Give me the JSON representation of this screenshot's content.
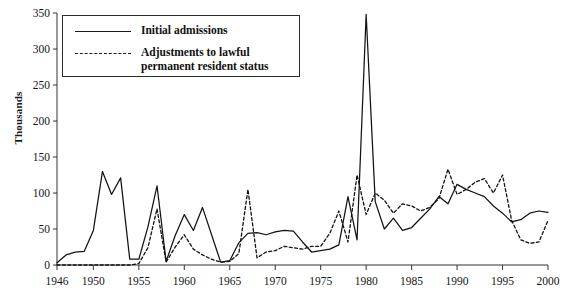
{
  "chart_data": {
    "type": "line",
    "title": "",
    "xlabel": "",
    "ylabel": "Thousands",
    "xlim": [
      1946,
      2000
    ],
    "ylim": [
      0,
      350
    ],
    "grid": false,
    "legend_position": "top-left",
    "ytick_labels": [
      "0",
      "50",
      "100",
      "150",
      "200",
      "250",
      "300",
      "350"
    ],
    "ytick_values": [
      0,
      50,
      100,
      150,
      200,
      250,
      300,
      350
    ],
    "xtick_labels": [
      "1946",
      "1950",
      "1955",
      "1960",
      "1965",
      "1970",
      "1975",
      "1980",
      "1985",
      "1990",
      "1995",
      "2000"
    ],
    "xtick_values": [
      1946,
      1950,
      1955,
      1960,
      1965,
      1970,
      1975,
      1980,
      1985,
      1990,
      1995,
      2000
    ],
    "x": [
      1946,
      1947,
      1948,
      1949,
      1950,
      1951,
      1952,
      1953,
      1954,
      1955,
      1956,
      1957,
      1958,
      1959,
      1960,
      1961,
      1962,
      1963,
      1964,
      1965,
      1966,
      1967,
      1968,
      1969,
      1970,
      1971,
      1972,
      1973,
      1974,
      1975,
      1976,
      1977,
      1978,
      1979,
      1980,
      1981,
      1982,
      1983,
      1984,
      1985,
      1986,
      1987,
      1988,
      1989,
      1990,
      1991,
      1992,
      1993,
      1994,
      1995,
      1996,
      1997,
      1998,
      1999,
      2000
    ],
    "series": [
      {
        "name": "Initial admissions",
        "style": "solid",
        "values": [
          3,
          14,
          18,
          19,
          48,
          130,
          98,
          121,
          8,
          8,
          53,
          110,
          5,
          41,
          70,
          48,
          80,
          42,
          4,
          6,
          31,
          44,
          45,
          42,
          46,
          48,
          47,
          32,
          18,
          20,
          22,
          28,
          95,
          35,
          348,
          88,
          50,
          65,
          48,
          52,
          65,
          78,
          95,
          85,
          112,
          105,
          100,
          95,
          82,
          72,
          60,
          63,
          72,
          75,
          73
        ],
        "note": "Refugee initial admissions, thousands"
      },
      {
        "name": "Adjustments to lawful permanent resident status",
        "style": "dashed",
        "values": [
          0,
          0,
          0,
          0,
          0,
          0,
          0,
          0,
          0,
          2,
          24,
          78,
          4,
          25,
          42,
          22,
          14,
          8,
          4,
          5,
          16,
          105,
          10,
          18,
          20,
          26,
          24,
          22,
          26,
          26,
          44,
          75,
          32,
          125,
          70,
          100,
          90,
          72,
          85,
          82,
          75,
          80,
          92,
          133,
          98,
          105,
          115,
          120,
          100,
          125,
          62,
          35,
          30,
          32,
          62
        ],
        "note": "Adjustments to lawful permanent resident status, thousands"
      }
    ]
  },
  "legend": {
    "items": [
      {
        "label": "Initial admissions",
        "style": "solid"
      },
      {
        "label": "Adjustments to lawful permanent resident status",
        "style": "dashed"
      }
    ]
  },
  "axis": {
    "y_title": "Thousands"
  }
}
